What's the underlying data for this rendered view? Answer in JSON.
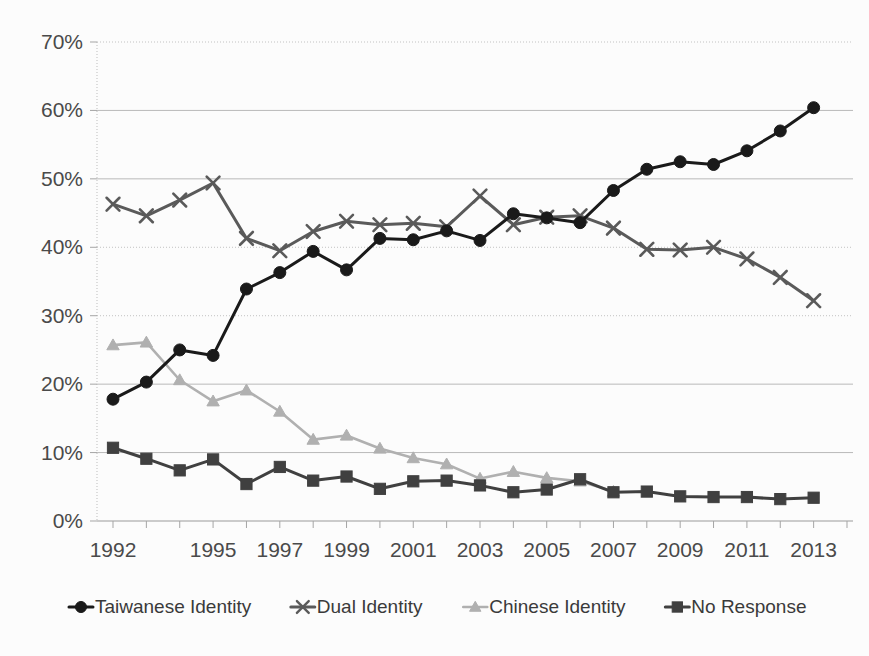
{
  "chart_data": {
    "type": "line",
    "title": "",
    "subtitle": "",
    "xlabel": "",
    "ylabel": "",
    "xlim": [
      1992,
      2014
    ],
    "ylim": [
      0,
      70
    ],
    "yticks": [
      "0%",
      "10%",
      "20%",
      "30%",
      "40%",
      "50%",
      "60%",
      "70%"
    ],
    "ytick_values": [
      0,
      10,
      20,
      30,
      40,
      50,
      60,
      70
    ],
    "x": [
      1992,
      1993,
      1994,
      1995,
      1996,
      1997,
      1998,
      1999,
      2000,
      2001,
      2002,
      2003,
      2004,
      2005,
      2006,
      2007,
      2008,
      2009,
      2010,
      2011,
      2012,
      2013,
      2014
    ],
    "xtick_labels": [
      "1992",
      "",
      "",
      "1995",
      "",
      "1997",
      "",
      "1999",
      "",
      "2001",
      "",
      "2003",
      "",
      "2005",
      "",
      "2007",
      "",
      "2009",
      "",
      "2011",
      "",
      "2013",
      ""
    ],
    "grid": true,
    "legend_position": "bottom",
    "series": [
      {
        "name": "Taiwanese Identity",
        "marker": "circle",
        "color": "#1a1a1a",
        "values": [
          17.8,
          20.3,
          25.0,
          24.2,
          33.9,
          36.3,
          39.4,
          36.7,
          41.3,
          41.1,
          42.4,
          41.0,
          44.9,
          44.3,
          43.6,
          48.3,
          51.4,
          52.5,
          52.1,
          54.1,
          57.0,
          60.4,
          null
        ]
      },
      {
        "name": "Dual Identity",
        "marker": "cross",
        "color": "#5a5a5a",
        "values": [
          46.3,
          44.6,
          46.9,
          49.4,
          41.3,
          39.5,
          42.3,
          43.8,
          43.3,
          43.5,
          43.0,
          47.5,
          43.3,
          44.4,
          44.6,
          42.8,
          39.7,
          39.6,
          40.0,
          38.3,
          35.6,
          32.2,
          null
        ]
      },
      {
        "name": "Chinese Identity",
        "marker": "triangle",
        "color": "#b0b0b0",
        "values": [
          25.7,
          26.1,
          20.6,
          17.5,
          19.1,
          16.0,
          11.9,
          12.5,
          10.6,
          9.2,
          8.3,
          6.2,
          7.2,
          6.3,
          5.8,
          4.3,
          null,
          null,
          null,
          null,
          null,
          null,
          null
        ]
      },
      {
        "name": "No Response",
        "marker": "square",
        "color": "#404040",
        "values": [
          10.7,
          9.1,
          7.4,
          9.0,
          5.4,
          7.9,
          5.9,
          6.5,
          4.7,
          5.8,
          5.9,
          5.2,
          4.2,
          4.6,
          6.1,
          4.2,
          4.3,
          3.6,
          3.5,
          3.5,
          3.2,
          3.4,
          null
        ]
      }
    ],
    "legend": [
      {
        "label": "Taiwanese Identity",
        "marker": "circle",
        "color": "#1a1a1a"
      },
      {
        "label": "Dual Identity",
        "marker": "cross",
        "color": "#5a5a5a"
      },
      {
        "label": "Chinese Identity",
        "marker": "triangle",
        "color": "#b0b0b0"
      },
      {
        "label": "No Response",
        "marker": "square",
        "color": "#404040"
      }
    ]
  },
  "axis": {
    "y_labels": [
      "70%",
      "60%",
      "50%",
      "40%",
      "30%",
      "20%",
      "10%",
      "0%"
    ],
    "x_labels": [
      "1992",
      "1995",
      "1997",
      "1999",
      "2001",
      "2003",
      "2005",
      "2007",
      "2009",
      "2011",
      "2013"
    ]
  }
}
